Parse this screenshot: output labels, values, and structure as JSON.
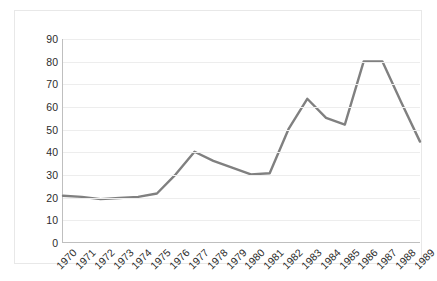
{
  "chart_data": {
    "type": "line",
    "title": "",
    "xlabel": "",
    "ylabel": "",
    "grid": true,
    "legend": "none",
    "xlim": [
      1970,
      1989
    ],
    "ylim": [
      0,
      90
    ],
    "ytick_step": 10,
    "categories": [
      "1970",
      "1971",
      "1972",
      "1973",
      "1974",
      "1975",
      "1976",
      "1977",
      "1978",
      "1979",
      "1980",
      "1981",
      "1982",
      "1983",
      "1984",
      "1985",
      "1986",
      "1987",
      "1988",
      "1989"
    ],
    "yticks": [
      "0",
      "10",
      "20",
      "30",
      "40",
      "50",
      "60",
      "70",
      "80",
      "90"
    ],
    "series": [
      {
        "name": "series-1",
        "color": "#808080",
        "values": [
          20.5,
          20,
          19,
          19.5,
          20,
          21.5,
          30,
          40,
          36,
          33,
          30,
          30.5,
          50,
          63.5,
          55,
          52,
          80,
          80,
          62,
          44.5
        ]
      }
    ]
  },
  "style": {
    "line_color": "#808080",
    "grid_color": "#ededed",
    "axis_color": "#bfbfbf",
    "text_color": "#2b2b2b",
    "background": "#ffffff",
    "frame_color": "#e8e8e8"
  }
}
